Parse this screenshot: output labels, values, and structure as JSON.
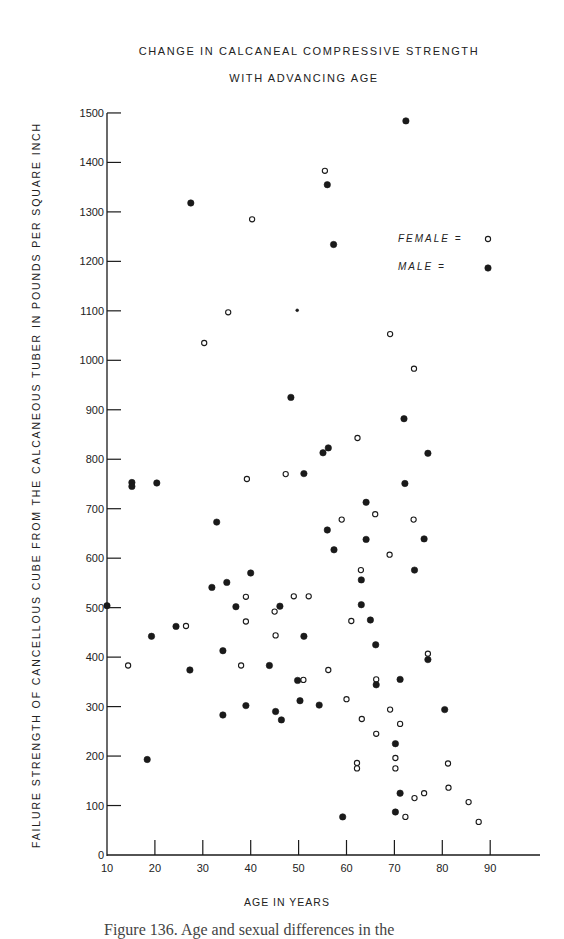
{
  "chart_data": {
    "type": "scatter",
    "title": "CHANGE IN CALCANEAL COMPRESSIVE STRENGTH",
    "subtitle": "WITH ADVANCING AGE",
    "xlabel": "AGE IN YEARS",
    "ylabel": "FAILURE STRENGTH OF CANCELLOUS CUBE FROM THE CALCANEOUS TUBER IN POUNDS PER SQUARE INCH",
    "xlim": [
      10,
      100
    ],
    "ylim": [
      0,
      1500
    ],
    "x_ticks": [
      10,
      20,
      30,
      40,
      50,
      60,
      70,
      80,
      90
    ],
    "y_ticks": [
      0,
      100,
      200,
      300,
      400,
      500,
      600,
      700,
      800,
      900,
      1000,
      1100,
      1200,
      1300,
      1400,
      1500
    ],
    "grid": false,
    "legend": {
      "position": "upper right",
      "entries": [
        {
          "label": "FEMALE =",
          "marker": "open-circle"
        },
        {
          "label": "MALE =",
          "marker": "filled-circle"
        }
      ]
    },
    "series": [
      {
        "name": "Female",
        "marker": "open-circle",
        "points": [
          [
            55.5,
            1383
          ],
          [
            40.3,
            1285
          ],
          [
            35.3,
            1097
          ],
          [
            30.3,
            1035
          ],
          [
            69.1,
            1053
          ],
          [
            74.1,
            983
          ],
          [
            62.3,
            843
          ],
          [
            47.3,
            770
          ],
          [
            39.2,
            760
          ],
          [
            66,
            689
          ],
          [
            59,
            678
          ],
          [
            74,
            678
          ],
          [
            69,
            607
          ],
          [
            63,
            576
          ],
          [
            39,
            522
          ],
          [
            49,
            523
          ],
          [
            52.1,
            523
          ],
          [
            45,
            492
          ],
          [
            39,
            472
          ],
          [
            61,
            473
          ],
          [
            26.5,
            463
          ],
          [
            45.2,
            444
          ],
          [
            77,
            407
          ],
          [
            14.4,
            383
          ],
          [
            38,
            383
          ],
          [
            56.2,
            374
          ],
          [
            51,
            354
          ],
          [
            66.2,
            355
          ],
          [
            60,
            315
          ],
          [
            69.1,
            294
          ],
          [
            63.2,
            275
          ],
          [
            71.2,
            265
          ],
          [
            66.2,
            245
          ],
          [
            70.2,
            196
          ],
          [
            62.2,
            186
          ],
          [
            62.2,
            175
          ],
          [
            70.2,
            175
          ],
          [
            81.2,
            185
          ],
          [
            81.3,
            136
          ],
          [
            76.2,
            125
          ],
          [
            74.2,
            115
          ],
          [
            85.5,
            107
          ],
          [
            72.3,
            77
          ],
          [
            87.6,
            67
          ]
        ]
      },
      {
        "name": "Male",
        "marker": "filled-circle",
        "points": [
          [
            72.4,
            1484
          ],
          [
            56,
            1355
          ],
          [
            27.5,
            1318
          ],
          [
            57.3,
            1234
          ],
          [
            49.7,
            1101
          ],
          [
            48.4,
            925
          ],
          [
            72,
            882
          ],
          [
            56.2,
            823
          ],
          [
            55.1,
            813
          ],
          [
            77,
            812
          ],
          [
            51.1,
            771
          ],
          [
            20.4,
            752
          ],
          [
            15.2,
            753
          ],
          [
            15.2,
            745
          ],
          [
            72.2,
            751
          ],
          [
            64.1,
            713
          ],
          [
            32.9,
            673
          ],
          [
            56,
            657
          ],
          [
            64.1,
            638
          ],
          [
            76.2,
            639
          ],
          [
            57.4,
            617
          ],
          [
            74.2,
            576
          ],
          [
            40,
            570
          ],
          [
            63.1,
            556
          ],
          [
            35,
            551
          ],
          [
            31.9,
            541
          ],
          [
            10,
            504
          ],
          [
            36.9,
            502
          ],
          [
            46.1,
            503
          ],
          [
            63.1,
            506
          ],
          [
            65,
            475
          ],
          [
            24.4,
            462
          ],
          [
            19.3,
            442
          ],
          [
            51.1,
            442
          ],
          [
            66.1,
            425
          ],
          [
            34.2,
            413
          ],
          [
            77,
            395
          ],
          [
            43.9,
            383
          ],
          [
            27.3,
            374
          ],
          [
            49.8,
            353
          ],
          [
            71.2,
            355
          ],
          [
            66.2,
            344
          ],
          [
            50.3,
            312
          ],
          [
            54.3,
            303
          ],
          [
            39,
            302
          ],
          [
            80.5,
            294
          ],
          [
            45.2,
            290
          ],
          [
            34.2,
            283
          ],
          [
            46.4,
            273
          ],
          [
            70.2,
            225
          ],
          [
            18.4,
            193
          ],
          [
            71.2,
            125
          ],
          [
            70.2,
            87
          ],
          [
            59.2,
            77
          ]
        ]
      }
    ]
  },
  "labels": {
    "title_line1": "CHANGE IN CALCANEAL COMPRESSIVE STRENGTH",
    "title_line2": "WITH ADVANCING AGE",
    "y_axis": "FAILURE STRENGTH OF CANCELLOUS CUBE FROM THE CALCANEOUS TUBER IN POUNDS PER SQUARE INCH",
    "x_axis": "AGE IN YEARS",
    "legend_female": "FEMALE =",
    "legend_male": "MALE =",
    "caption": "Figure 136. Age and sexual differences in the"
  },
  "colors": {
    "ink": "#1a1a1a",
    "background": "#ffffff"
  }
}
